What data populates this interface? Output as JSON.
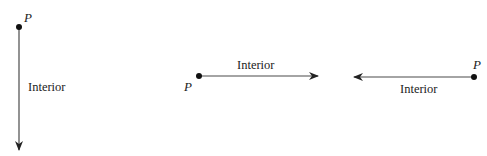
{
  "diagram": {
    "type": "rays",
    "rays": [
      {
        "orientation": "vertical-down",
        "endpoint_label": "P",
        "interior_label": "Interior",
        "endpoint": [
          19,
          27
        ],
        "tip": [
          19,
          150
        ]
      },
      {
        "orientation": "horizontal-right",
        "endpoint_label": "P",
        "interior_label": "Interior",
        "endpoint": [
          199,
          76
        ],
        "tip": [
          318,
          76
        ]
      },
      {
        "orientation": "horizontal-left",
        "endpoint_label": "P",
        "interior_label": "Interior",
        "endpoint": [
          474,
          77
        ],
        "tip": [
          354,
          77
        ]
      }
    ],
    "colors": {
      "line": "#4a4a4a",
      "point": "#111111",
      "text": "#222222"
    }
  }
}
